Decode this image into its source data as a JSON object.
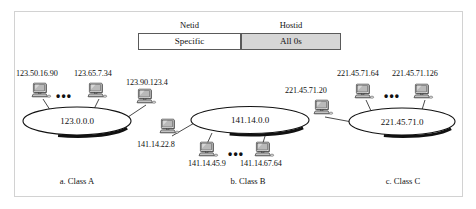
{
  "figure": {
    "header": {
      "netid_label": "Netid",
      "hostid_label": "Hostid",
      "netid_cell": "Specific",
      "hostid_cell": "All 0s",
      "netid_cell_color": "#ffffff",
      "hostid_cell_color": "#d6d6d6"
    },
    "dots": "•••",
    "networks": [
      {
        "id": "class-a",
        "caption": "a. Class A",
        "network_address": "123.0.0.0",
        "hosts": [
          "123.50.16.90",
          "123.65.7.34",
          "123.90.123.4"
        ]
      },
      {
        "id": "class-b",
        "caption": "b. Class B",
        "network_address": "141.14.0.0",
        "hosts": [
          "141.14.22.8",
          "141.14.45.9",
          "141.14.67.64"
        ]
      },
      {
        "id": "class-c",
        "caption": "c. Class C",
        "network_address": "221.45.71.0",
        "hosts": [
          "221.45.71.20",
          "221.45.71.64",
          "221.45.71.126"
        ]
      }
    ]
  }
}
